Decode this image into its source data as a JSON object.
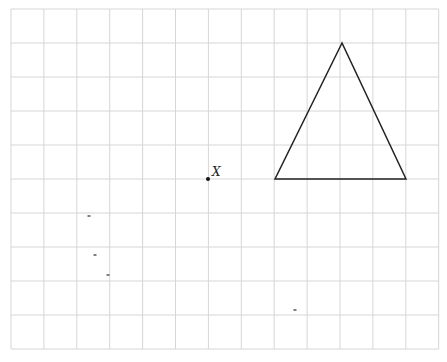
{
  "grid": {
    "x0": 11,
    "y0": 9,
    "cols": 13,
    "rows": 10,
    "cell_w": 32.9,
    "cell_h": 34,
    "line_color": "#d6d6d6"
  },
  "point": {
    "label": "X",
    "x": 208,
    "y": 179,
    "color": "#111111"
  },
  "triangle": {
    "vertices": [
      [
        342,
        43
      ],
      [
        275,
        179
      ],
      [
        406,
        179
      ]
    ],
    "stroke": "#222222"
  },
  "stray_marks": [
    [
      89,
      216
    ],
    [
      95,
      255
    ],
    [
      108,
      275
    ],
    [
      295,
      310
    ]
  ]
}
